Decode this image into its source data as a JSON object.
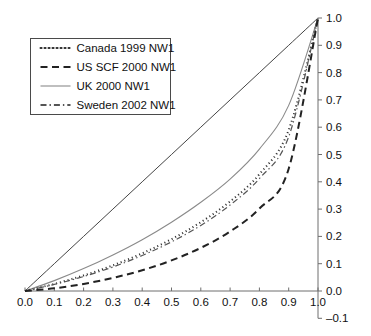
{
  "chart_data": {
    "type": "line",
    "title": "",
    "subtitle": "",
    "xlabel": "",
    "ylabel": "",
    "xlim": [
      0.0,
      1.0
    ],
    "ylim": [
      -0.1,
      1.0
    ],
    "grid": false,
    "legend_position": "top-left",
    "x_ticks": [
      "0.0",
      "0.1",
      "0.2",
      "0.3",
      "0.4",
      "0.5",
      "0.6",
      "0.7",
      "0.8",
      "0.9",
      "1.0"
    ],
    "x_tick_values": [
      0.0,
      0.1,
      0.2,
      0.3,
      0.4,
      0.5,
      0.6,
      0.7,
      0.8,
      0.9,
      1.0
    ],
    "y_ticks": [
      "1.0",
      "0.9",
      "0.8",
      "0.7",
      "0.6",
      "0.5",
      "0.4",
      "0.3",
      "0.2",
      "0.1",
      "0.0",
      "-0.1"
    ],
    "y_tick_values": [
      1.0,
      0.9,
      0.8,
      0.7,
      0.6,
      0.5,
      0.4,
      0.3,
      0.2,
      0.1,
      0.0,
      -0.1
    ],
    "x": [
      0.0,
      0.1,
      0.2,
      0.3,
      0.4,
      0.5,
      0.6,
      0.7,
      0.8,
      0.9,
      1.0
    ],
    "series": [
      {
        "name": "equality-line",
        "label": "",
        "style": "solid",
        "color": "#444444",
        "width": 1.0,
        "in_legend": false,
        "values": [
          0.0,
          0.1,
          0.2,
          0.3,
          0.4,
          0.5,
          0.6,
          0.7,
          0.8,
          0.9,
          1.0
        ]
      },
      {
        "name": "uk-2000-nw1",
        "label": "UK 2000 NW1",
        "style": "solid",
        "color": "#8a8a8a",
        "width": 1.1,
        "in_legend": true,
        "values": [
          0.0,
          0.038,
          0.082,
          0.132,
          0.188,
          0.252,
          0.325,
          0.41,
          0.52,
          0.68,
          1.0
        ]
      },
      {
        "name": "canada-1999-nw1",
        "label": "Canada 1999 NW1",
        "style": "dotted",
        "color": "#333333",
        "width": 2.0,
        "in_legend": true,
        "values": [
          0.0,
          0.026,
          0.057,
          0.094,
          0.138,
          0.19,
          0.252,
          0.328,
          0.428,
          0.59,
          1.0
        ]
      },
      {
        "name": "sweden-2002-nw1",
        "label": "Sweden 2002 NW1",
        "style": "dash-dot",
        "color": "#555555",
        "width": 1.2,
        "in_legend": true,
        "values": [
          0.0,
          0.024,
          0.053,
          0.088,
          0.13,
          0.18,
          0.24,
          0.315,
          0.412,
          0.565,
          1.0
        ]
      },
      {
        "name": "us-scf-2000-nw1",
        "label": "US SCF 2000 NW1",
        "style": "dashed",
        "color": "#222222",
        "width": 2.0,
        "in_legend": true,
        "values": [
          0.0,
          0.01,
          0.026,
          0.048,
          0.076,
          0.112,
          0.158,
          0.218,
          0.302,
          0.448,
          1.0
        ]
      }
    ],
    "legend": [
      {
        "label": "Canada 1999 NW1",
        "style": "dotted",
        "color": "#333333"
      },
      {
        "label": "US SCF 2000 NW1",
        "style": "dashed",
        "color": "#222222"
      },
      {
        "label": "UK 2000 NW1",
        "style": "solid",
        "color": "#8a8a8a"
      },
      {
        "label": "Sweden 2002 NW1",
        "style": "dash-dot",
        "color": "#555555"
      }
    ]
  }
}
